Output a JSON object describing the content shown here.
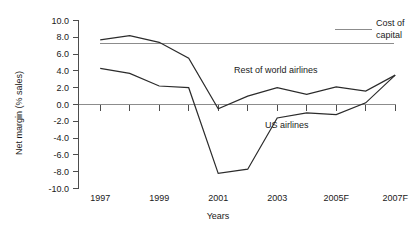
{
  "chart_data": {
    "type": "line",
    "title": "",
    "xlabel": "Years",
    "ylabel": "Net margin (% sales)",
    "x": [
      1997,
      1998,
      1999,
      2000,
      2001,
      2002,
      2003,
      2004,
      2005,
      2006,
      2007
    ],
    "x_tick_labels": [
      "1997",
      "",
      "1999",
      "",
      "2001",
      "",
      "2003",
      "",
      "2005F",
      "",
      "2007F"
    ],
    "x_tick_labels_visible": [
      "1997",
      "1999",
      "2001",
      "2003",
      "2005F",
      "2007F"
    ],
    "ylim": [
      -10.0,
      10.0
    ],
    "y_ticks": [
      10.0,
      8.0,
      6.0,
      4.0,
      2.0,
      0.0,
      -2.0,
      -4.0,
      -6.0,
      -8.0,
      -10.0
    ],
    "y_tick_labels": [
      "10.0",
      "8.0",
      "6.0",
      "4.0",
      "2.0",
      "0.0",
      "-2.0",
      "-4.0",
      "-6.0",
      "-8.0",
      "-10.0"
    ],
    "grid": false,
    "legend_position": "inline-annotations",
    "series": [
      {
        "name": "Rest of world airlines",
        "label": "Rest of world airlines",
        "color": "#2b2b2b",
        "values": [
          7.7,
          8.2,
          7.4,
          5.5,
          -0.5,
          1.0,
          2.0,
          1.2,
          2.1,
          1.6,
          3.5
        ]
      },
      {
        "name": "US airlines",
        "label": "US airlines",
        "color": "#2b2b2b",
        "values": [
          4.3,
          3.7,
          2.2,
          2.0,
          -8.2,
          -7.7,
          -1.6,
          -1.0,
          -1.2,
          0.2,
          3.5
        ]
      },
      {
        "name": "Cost of capital",
        "label": "Cost of capital",
        "color": "#8c8c8c",
        "constant": 7.3,
        "values": [
          7.3,
          7.3,
          7.3,
          7.3,
          7.3,
          7.3,
          7.3,
          7.3,
          7.3,
          7.3,
          7.3
        ]
      }
    ],
    "annotations": [
      {
        "text": "Cost of",
        "x": 372,
        "y": 24
      },
      {
        "text": "capital",
        "x": 372,
        "y": 36
      },
      {
        "text": "Rest of world airlines",
        "x": 234,
        "y": 70
      },
      {
        "text": "US airlines",
        "x": 262,
        "y": 125
      }
    ]
  },
  "labels": {
    "y_axis_title": "Net margin (% sales)",
    "x_axis_title": "Years",
    "cost_of_capital_line1": "Cost of",
    "cost_of_capital_line2": "capital",
    "rest_of_world": "Rest of world airlines",
    "us_airlines": "US airlines",
    "y0": "10.0",
    "y1": "8.0",
    "y2": "6.0",
    "y3": "4.0",
    "y4": "2.0",
    "y5": "0.0",
    "y6": "-2.0",
    "y7": "-4.0",
    "y8": "-6.0",
    "y9": "-8.0",
    "y10": "-10.0",
    "x0": "1997",
    "x1": "1999",
    "x2": "2001",
    "x3": "2003",
    "x4": "2005F",
    "x5": "2007F"
  }
}
